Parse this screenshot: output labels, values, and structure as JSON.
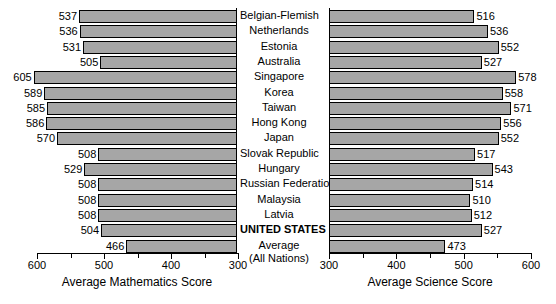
{
  "chart_data": {
    "type": "bar",
    "title": "",
    "orientation": "horizontal-paired",
    "categories": [
      "Belgian-Flemish",
      "Netherlands",
      "Estonia",
      "Australia",
      "Singapore",
      "Korea",
      "Taiwan",
      "Hong Kong",
      "Japan",
      "Slovak Republic",
      "Hungary",
      "Russian Federation",
      "Malaysia",
      "Latvia",
      "UNITED STATES",
      "Average"
    ],
    "category_sublabels": [
      "",
      "",
      "",
      "",
      "",
      "",
      "",
      "",
      "",
      "",
      "",
      "",
      "",
      "",
      "",
      "(All Nations)"
    ],
    "category_bold": [
      false,
      false,
      false,
      false,
      false,
      false,
      false,
      false,
      false,
      false,
      false,
      false,
      false,
      false,
      true,
      false
    ],
    "series": [
      {
        "name": "Average Mathematics Score",
        "panel": "left",
        "values": [
          537,
          536,
          531,
          505,
          605,
          589,
          585,
          586,
          570,
          508,
          529,
          508,
          508,
          508,
          504,
          466
        ]
      },
      {
        "name": "Average Science Score",
        "panel": "right",
        "values": [
          516,
          536,
          552,
          527,
          578,
          558,
          571,
          556,
          552,
          517,
          543,
          514,
          510,
          512,
          527,
          473
        ]
      }
    ],
    "grid": false,
    "legend": "none",
    "bar_color": "#a6a6a6",
    "bar_border_color": "#000000"
  },
  "panels": {
    "left": {
      "axis_title": "Average Mathematics Score",
      "xlim": [
        600,
        300
      ],
      "reversed": true,
      "major_ticks": [
        600,
        500,
        400,
        300
      ],
      "minor_ticks": [
        550,
        450,
        350
      ],
      "tick_labels": [
        "600",
        "500",
        "400",
        "300"
      ]
    },
    "right": {
      "axis_title": "Average Science Score",
      "xlim": [
        300,
        600
      ],
      "reversed": false,
      "major_ticks": [
        300,
        400,
        500,
        600
      ],
      "minor_ticks": [
        350,
        450,
        550
      ],
      "tick_labels": [
        "300",
        "400",
        "500",
        "600"
      ]
    }
  }
}
